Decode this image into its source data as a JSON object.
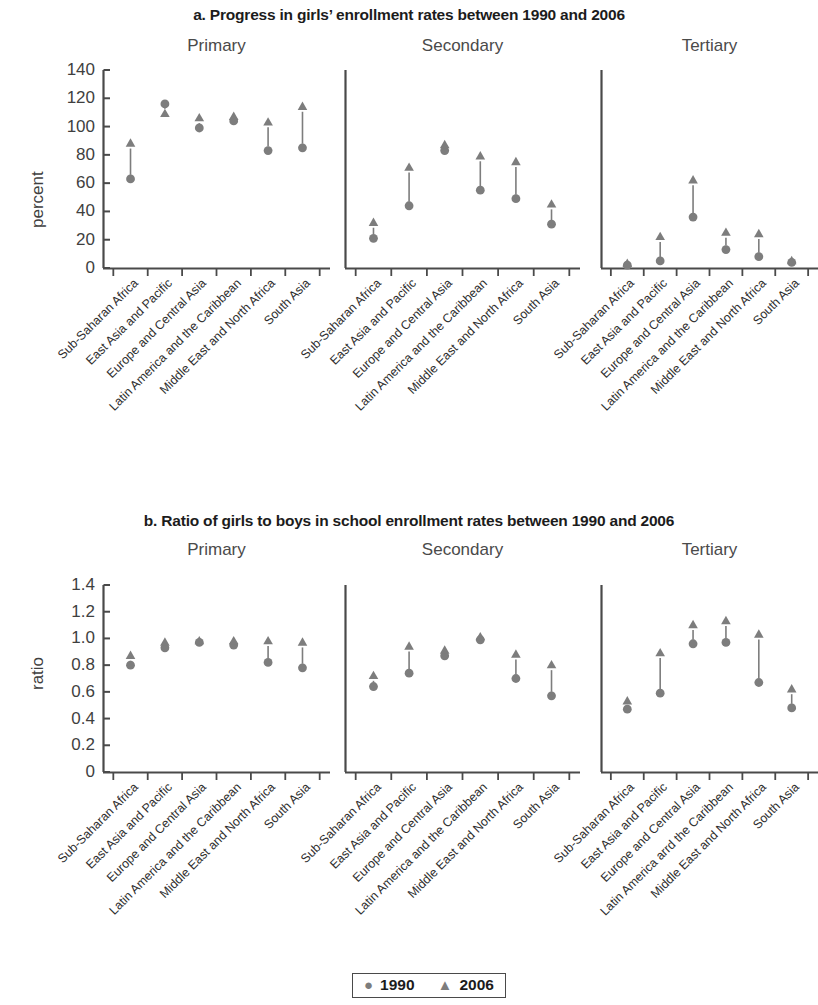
{
  "figure": {
    "title_a": "a. Progress in girls’ enrollment rates between 1990 and 2006",
    "title_b": "b. Ratio of girls to boys in school enrollment rates between 1990 and 2006",
    "marker_color": "#7d7d7d",
    "axis_color": "#4a4a4a"
  },
  "legend": {
    "circle_glyph": "●",
    "circle_label": "1990",
    "triangle_glyph": "▲",
    "triangle_label": "2006"
  },
  "panels": {
    "primary": "Primary",
    "secondary": "Secondary",
    "tertiary": "Tertiary"
  },
  "regions": [
    "Sub-Saharan Africa",
    "East Asia and Pacific",
    "Europe and Central Asia",
    "Latin America and the Caribbean",
    "Middle East and North Africa",
    "South Asia"
  ],
  "regions_b_tertiary": [
    "Sub-Saharan Africa",
    "East Asia and Pacific",
    "Europe and Central Asia",
    "Latin America arrd the Caribbean",
    "Middle East and North Africa",
    "South Asia"
  ],
  "chart_data": [
    {
      "type": "scatter",
      "id": "a",
      "title": "a. Progress in girls’ enrollment rates between 1990 and 2006",
      "ylabel": "percent",
      "xlabel": "",
      "ylim": [
        0,
        140
      ],
      "yticks": [
        0,
        20,
        40,
        60,
        80,
        100,
        120,
        140
      ],
      "ytick_labels": [
        "0",
        "20",
        "40",
        "60",
        "80",
        "100",
        "120",
        "140"
      ],
      "grid": false,
      "legend_position": "bottom-center",
      "categories": [
        "Sub-Saharan Africa",
        "East Asia and Pacific",
        "Europe and Central Asia",
        "Latin America and the Caribbean",
        "Middle East and North Africa",
        "South Asia"
      ],
      "facets": [
        {
          "name": "Primary",
          "series": [
            {
              "name": "1990",
              "marker": "circle",
              "values": [
                63,
                116,
                99,
                104,
                83,
                85
              ]
            },
            {
              "name": "2006",
              "marker": "triangle",
              "values": [
                88,
                109,
                106,
                107,
                103,
                114
              ]
            }
          ]
        },
        {
          "name": "Secondary",
          "series": [
            {
              "name": "1990",
              "marker": "circle",
              "values": [
                21,
                44,
                83,
                55,
                49,
                31
              ]
            },
            {
              "name": "2006",
              "marker": "triangle",
              "values": [
                32,
                71,
                87,
                79,
                75,
                45
              ]
            }
          ]
        },
        {
          "name": "Tertiary",
          "series": [
            {
              "name": "1990",
              "marker": "circle",
              "values": [
                2,
                5,
                36,
                13,
                8,
                4
              ]
            },
            {
              "name": "2006",
              "marker": "triangle",
              "values": [
                3,
                22,
                62,
                25,
                24,
                5
              ]
            }
          ]
        }
      ]
    },
    {
      "type": "scatter",
      "id": "b",
      "title": "b. Ratio of girls to boys in school enrollment rates between 1990 and 2006",
      "ylabel": "ratio",
      "xlabel": "",
      "ylim": [
        0,
        1.4
      ],
      "yticks": [
        0,
        0.2,
        0.4,
        0.6,
        0.8,
        1.0,
        1.2,
        1.4
      ],
      "ytick_labels": [
        "0",
        "0.2",
        "0.4",
        "0.6",
        "0.8",
        "1.0",
        "1.2",
        "1.4"
      ],
      "grid": false,
      "legend_position": "bottom-center",
      "categories": [
        "Sub-Saharan Africa",
        "East Asia and Pacific",
        "Europe and Central Asia",
        "Latin America and the Caribbean",
        "Middle East and North Africa",
        "South Asia"
      ],
      "facets": [
        {
          "name": "Primary",
          "series": [
            {
              "name": "1990",
              "marker": "circle",
              "values": [
                0.8,
                0.93,
                0.97,
                0.95,
                0.82,
                0.78
              ]
            },
            {
              "name": "2006",
              "marker": "triangle",
              "values": [
                0.87,
                0.97,
                0.98,
                0.98,
                0.98,
                0.97
              ]
            }
          ]
        },
        {
          "name": "Secondary",
          "series": [
            {
              "name": "1990",
              "marker": "circle",
              "values": [
                0.64,
                0.74,
                0.87,
                0.99,
                0.7,
                0.57
              ]
            },
            {
              "name": "2006",
              "marker": "triangle",
              "values": [
                0.72,
                0.94,
                0.91,
                1.01,
                0.88,
                0.8
              ]
            }
          ]
        },
        {
          "name": "Tertiary",
          "series": [
            {
              "name": "1990",
              "marker": "circle",
              "values": [
                0.47,
                0.59,
                0.96,
                0.97,
                0.67,
                0.48
              ]
            },
            {
              "name": "2006",
              "marker": "triangle",
              "values": [
                0.53,
                0.89,
                1.1,
                1.13,
                1.03,
                0.62
              ]
            }
          ]
        }
      ]
    }
  ]
}
